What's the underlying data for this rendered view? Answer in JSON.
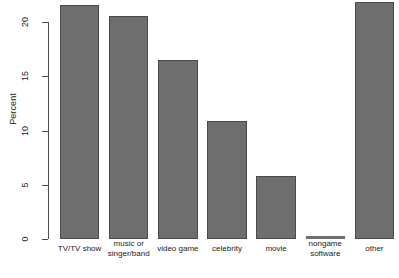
{
  "chart_data": {
    "type": "bar",
    "title": "",
    "xlabel": "",
    "ylabel": "Percent",
    "categories": [
      "TV/TV show",
      "music or\nsinger/band",
      "video game",
      "celebrity",
      "movie",
      "nongame\nsoftware",
      "other"
    ],
    "values": [
      21.6,
      20.6,
      16.5,
      10.9,
      5.8,
      0.3,
      21.8
    ],
    "ylim": [
      0,
      22.5
    ],
    "yticks": [
      0,
      5,
      10,
      15,
      20
    ],
    "ytick_labels": [
      "0",
      "5",
      "10",
      "15",
      "20"
    ],
    "grid": false,
    "legend": null,
    "bar_color": "#6e6e6e",
    "bar_border_color": "#4a4a4a",
    "axis_color": "#4d4d4d",
    "background": "#ffffff"
  },
  "axis": {
    "y_label": "Percent"
  }
}
